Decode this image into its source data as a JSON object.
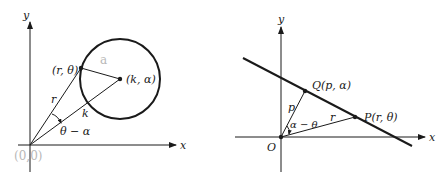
{
  "figures": [
    {
      "id": "circle-polar",
      "axes": {
        "x_label": "x",
        "y_label": "y"
      },
      "labels": {
        "point": "(r, θ)",
        "center": "(k, α)",
        "radius_segment": "r",
        "center_distance": "k",
        "angle": "θ − α"
      },
      "annotations": {
        "pencil_origin": "(0,0)",
        "pencil_radius": "a"
      }
    },
    {
      "id": "line-polar",
      "axes": {
        "x_label": "x",
        "y_label": "y",
        "origin_label": "O"
      },
      "labels": {
        "foot_point": "Q(p, α)",
        "line_point": "P(r, θ)",
        "perpendicular": "p",
        "radius_segment": "r",
        "angle": "α − θ"
      }
    }
  ],
  "colors": {
    "ink": "#1a1a1a",
    "pencil": "#b8b8b8",
    "background": "#ffffff"
  }
}
